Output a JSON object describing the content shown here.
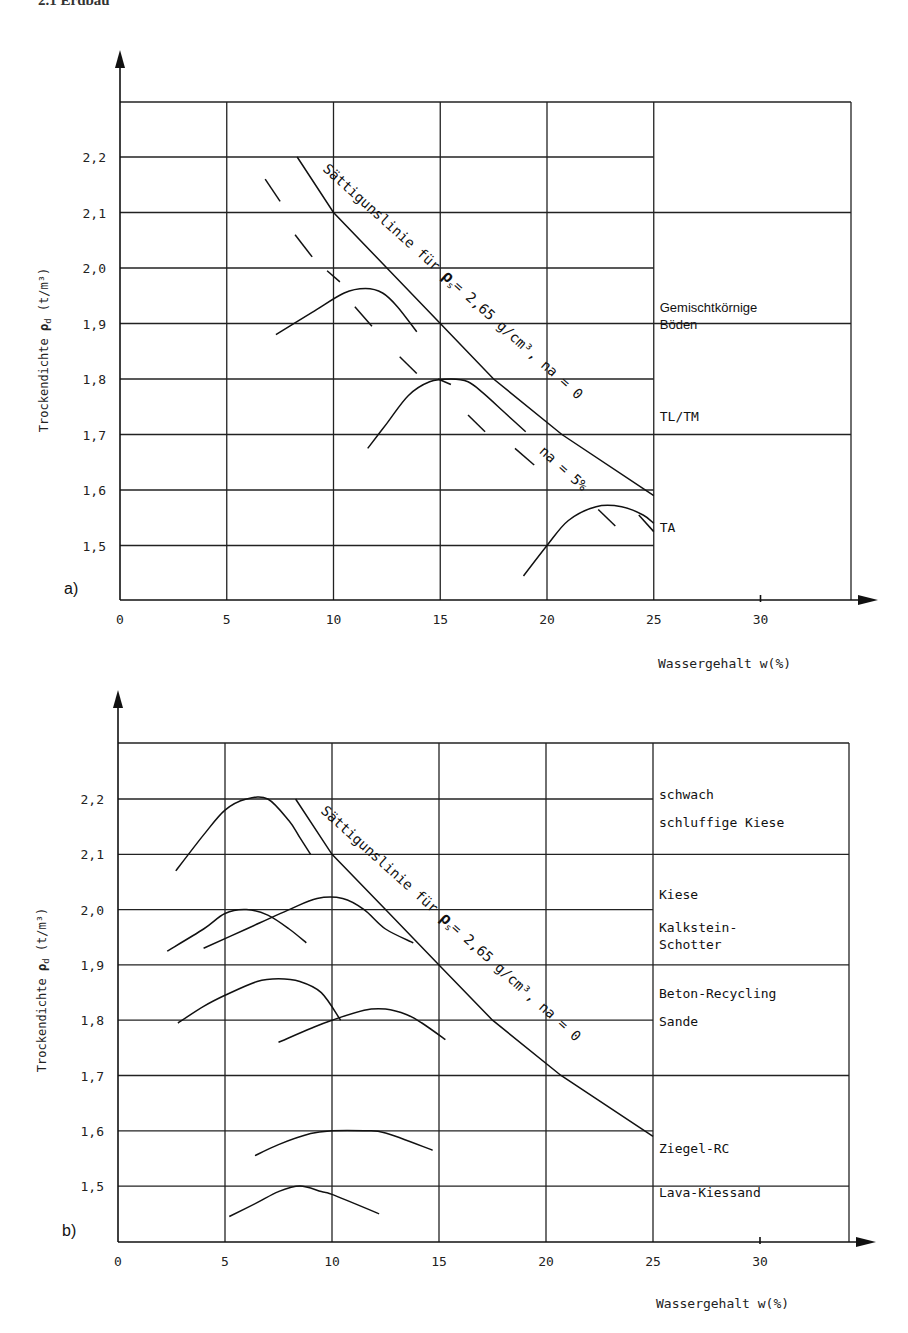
{
  "header": {
    "title": "2.1 Erdbau"
  },
  "chart_data": [
    {
      "panel": "a)",
      "type": "line",
      "title": "",
      "xlabel": "Wassergehalt w(%)",
      "ylabel": "Trockendichte ρd (t/m³)",
      "xlim": [
        0,
        35
      ],
      "ylim": [
        1.4,
        2.3
      ],
      "x_ticks": [
        "0",
        "5",
        "10",
        "15",
        "20",
        "25",
        "30"
      ],
      "y_ticks": [
        "1,5",
        "1,6",
        "1,7",
        "1,8",
        "1,9",
        "2,0",
        "2,1",
        "2,2"
      ],
      "grid": true,
      "saturation_line": {
        "label": "Sättigunslinie für ρs = 2,65 g/cm³, na = 0",
        "points": [
          [
            8.3,
            2.2
          ],
          [
            10,
            2.1
          ],
          [
            12.5,
            2.0
          ],
          [
            15,
            1.9
          ],
          [
            17.5,
            1.8
          ],
          [
            20.7,
            1.7
          ],
          [
            25,
            1.59
          ]
        ]
      },
      "air_void_line": {
        "label": "na = 5%",
        "segments": [
          [
            [
              6.8,
              2.16
            ],
            [
              7.5,
              2.12
            ]
          ],
          [
            [
              8.2,
              2.06
            ],
            [
              9,
              2.02
            ]
          ],
          [
            [
              9.7,
              1.995
            ],
            [
              10.3,
              1.975
            ]
          ],
          [
            [
              11,
              1.93
            ],
            [
              11.8,
              1.895
            ]
          ],
          [
            [
              13.1,
              1.84
            ],
            [
              13.9,
              1.81
            ]
          ],
          [
            [
              14.9,
              1.8
            ],
            [
              15.5,
              1.79
            ]
          ],
          [
            [
              16.3,
              1.735
            ],
            [
              17.1,
              1.705
            ]
          ],
          [
            [
              18.5,
              1.675
            ],
            [
              19.4,
              1.645
            ]
          ],
          [
            [
              24.3,
              1.555
            ],
            [
              25,
              1.525
            ]
          ],
          [
            [
              22.4,
              1.565
            ],
            [
              23.2,
              1.535
            ]
          ]
        ]
      },
      "series": [
        {
          "name": "Gemischtkörnige Böden",
          "points": [
            [
              7.3,
              1.88
            ],
            [
              9,
              1.92
            ],
            [
              10.5,
              1.955
            ],
            [
              11.5,
              1.963
            ],
            [
              12.3,
              1.955
            ],
            [
              13,
              1.93
            ],
            [
              13.9,
              1.885
            ]
          ]
        },
        {
          "name": "TL/TM",
          "points": [
            [
              11.6,
              1.675
            ],
            [
              12.5,
              1.72
            ],
            [
              13.5,
              1.77
            ],
            [
              14.5,
              1.795
            ],
            [
              15.5,
              1.8
            ],
            [
              16.3,
              1.795
            ],
            [
              17,
              1.775
            ],
            [
              18,
              1.74
            ],
            [
              19,
              1.705
            ]
          ]
        },
        {
          "name": "TA",
          "points": [
            [
              18.9,
              1.445
            ],
            [
              20,
              1.5
            ],
            [
              21,
              1.545
            ],
            [
              22.3,
              1.57
            ],
            [
              23.5,
              1.57
            ],
            [
              24.5,
              1.555
            ],
            [
              25,
              1.54
            ]
          ]
        }
      ],
      "category_labels": [
        {
          "text": [
            "Gemischtkörnige",
            "Böden"
          ],
          "y": 1.92
        },
        {
          "text": [
            "TL/TM"
          ],
          "y": 1.725
        },
        {
          "text": [
            "TA"
          ],
          "y": 1.525
        }
      ]
    },
    {
      "panel": "b)",
      "type": "line",
      "title": "",
      "xlabel": "Wassergehalt w(%)",
      "ylabel": "Trockendichte ρd (t/m³)",
      "xlim": [
        0,
        35
      ],
      "ylim": [
        1.4,
        2.3
      ],
      "x_ticks": [
        "0",
        "5",
        "10",
        "15",
        "20",
        "25",
        "30"
      ],
      "y_ticks": [
        "1,5",
        "1,6",
        "1,7",
        "1,8",
        "1,9",
        "2,0",
        "2,1",
        "2,2"
      ],
      "grid": true,
      "saturation_line": {
        "label": "Sättigunslinie für ρs = 2,65 g/cm³, na = 0",
        "points": [
          [
            8.3,
            2.2
          ],
          [
            10,
            2.1
          ],
          [
            12.5,
            2.0
          ],
          [
            15,
            1.9
          ],
          [
            17.5,
            1.8
          ],
          [
            20.7,
            1.7
          ],
          [
            25,
            1.59
          ]
        ]
      },
      "series": [
        {
          "name": "schwach schluffige Kiese",
          "points": [
            [
              2.7,
              2.07
            ],
            [
              4,
              2.135
            ],
            [
              5,
              2.18
            ],
            [
              6,
              2.2
            ],
            [
              7,
              2.2
            ],
            [
              8,
              2.16
            ],
            [
              8.5,
              2.13
            ],
            [
              9,
              2.1
            ]
          ]
        },
        {
          "name": "Kiese",
          "points": [
            [
              2.3,
              1.925
            ],
            [
              4,
              1.965
            ],
            [
              5,
              1.993
            ],
            [
              6,
              2.0
            ],
            [
              7,
              1.99
            ],
            [
              8,
              1.965
            ],
            [
              8.8,
              1.94
            ]
          ]
        },
        {
          "name": "Kalkstein-Schotter",
          "points": [
            [
              4,
              1.93
            ],
            [
              6,
              1.965
            ],
            [
              8,
              2.0
            ],
            [
              9.3,
              2.02
            ],
            [
              10.5,
              2.02
            ],
            [
              11.5,
              2.0
            ],
            [
              12.5,
              1.965
            ],
            [
              13.8,
              1.94
            ]
          ]
        },
        {
          "name": "Beton-Recycling",
          "points": [
            [
              2.8,
              1.795
            ],
            [
              4,
              1.825
            ],
            [
              5,
              1.845
            ],
            [
              6.5,
              1.87
            ],
            [
              7.5,
              1.875
            ],
            [
              8.5,
              1.87
            ],
            [
              9.5,
              1.85
            ],
            [
              10.4,
              1.8
            ]
          ]
        },
        {
          "name": "Sande",
          "points": [
            [
              7.5,
              1.76
            ],
            [
              9,
              1.785
            ],
            [
              10,
              1.8
            ],
            [
              11.5,
              1.818
            ],
            [
              12.5,
              1.82
            ],
            [
              13.5,
              1.81
            ],
            [
              14.2,
              1.795
            ],
            [
              15.3,
              1.765
            ]
          ]
        },
        {
          "name": "Ziegel-RC",
          "points": [
            [
              6.4,
              1.555
            ],
            [
              7.5,
              1.575
            ],
            [
              9,
              1.595
            ],
            [
              10,
              1.6
            ],
            [
              11.5,
              1.6
            ],
            [
              12.5,
              1.596
            ],
            [
              14.7,
              1.565
            ]
          ]
        },
        {
          "name": "Lava-Kiessand",
          "points": [
            [
              5.2,
              1.445
            ],
            [
              6.5,
              1.47
            ],
            [
              7.5,
              1.49
            ],
            [
              8.5,
              1.5
            ],
            [
              9.5,
              1.49
            ],
            [
              10,
              1.485
            ],
            [
              12.2,
              1.45
            ]
          ]
        }
      ],
      "category_labels": [
        {
          "text": [
            "schwach"
          ],
          "y": 2.2
        },
        {
          "text": [
            "schluffige Kiese"
          ],
          "y": 2.15
        },
        {
          "text": [
            "Kiese"
          ],
          "y": 2.02
        },
        {
          "text": [
            "Kalkstein-",
            "Schotter"
          ],
          "y": 1.96
        },
        {
          "text": [
            "Beton-Recycling"
          ],
          "y": 1.84
        },
        {
          "text": [
            "Sande"
          ],
          "y": 1.79
        },
        {
          "text": [
            "Ziegel-RC"
          ],
          "y": 1.56
        },
        {
          "text": [
            "Lava-Kiessand"
          ],
          "y": 1.48
        }
      ]
    }
  ],
  "labels": {
    "panel_a": "a)",
    "panel_b": "b)",
    "xlabel": "Wassergehalt w(%)",
    "ylabel_main": "Trockendichte ",
    "ylabel_symbol": "ρd",
    "ylabel_unit": " (t/m³)",
    "sat_word1": "Sättigunslinie",
    "sat_word2": "für",
    "sat_rho": "ρs",
    "sat_eq": "= 2,65 g/cm³, na = 0",
    "na5": "na = 5%"
  }
}
